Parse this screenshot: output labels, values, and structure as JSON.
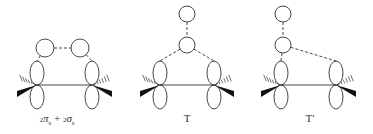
{
  "diagrams": [
    {
      "id": "pi-sigma",
      "label": "₂πₛ + ₂σₛ",
      "label_parts": {
        "pre1": "2",
        "sym1": "π",
        "sub1": "s",
        "plus": "+",
        "pre2": "2",
        "sym2": "σ",
        "sub2": "s"
      },
      "label_x": 57,
      "p_orbitals": [
        {
          "x": 37,
          "y": 85
        },
        {
          "x": 92,
          "y": 85
        }
      ],
      "circles": [
        {
          "x": 45,
          "y": 48,
          "r": 9
        },
        {
          "x": 80,
          "y": 48,
          "r": 9
        }
      ],
      "dashed_links": [
        [
          "c0",
          "c1"
        ],
        [
          "c0",
          "p0"
        ],
        [
          "c1",
          "p1"
        ]
      ]
    },
    {
      "id": "T",
      "label": "T",
      "label_x": 187,
      "p_orbitals": [
        {
          "x": 160,
          "y": 85
        },
        {
          "x": 214,
          "y": 85
        }
      ],
      "circles": [
        {
          "x": 187,
          "y": 14,
          "r": 8
        },
        {
          "x": 187,
          "y": 45,
          "r": 8
        }
      ],
      "dashed_links": [
        [
          "c0",
          "c1"
        ],
        [
          "c1",
          "p0"
        ],
        [
          "c1",
          "p1"
        ]
      ]
    },
    {
      "id": "T-prime",
      "label": "T′",
      "label_x": 310,
      "p_orbitals": [
        {
          "x": 281,
          "y": 85
        },
        {
          "x": 336,
          "y": 85
        }
      ],
      "circles": [
        {
          "x": 283,
          "y": 14,
          "r": 8
        },
        {
          "x": 283,
          "y": 45,
          "r": 8
        }
      ],
      "dashed_links": [
        [
          "c0",
          "c1"
        ],
        [
          "c1",
          "p0"
        ],
        [
          "c1",
          "p1"
        ]
      ]
    }
  ],
  "colors": {
    "stroke": "#333333",
    "fill_wedge": "#111111",
    "background": "#ffffff"
  }
}
